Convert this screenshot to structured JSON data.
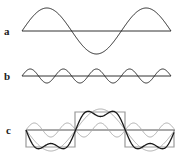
{
  "figure": {
    "panels": [
      {
        "label": "a",
        "description": "fundamental sine wave, 1.5 cycles, large amplitude"
      },
      {
        "label": "b",
        "description": "third harmonic sine wave, smaller amplitude"
      },
      {
        "label": "c",
        "description": "square wave with Fourier approximations (fundamental + harmonics)"
      }
    ]
  },
  "colors": {
    "dark": "#1a1a1a",
    "mid": "#555555",
    "light": "#9a9a9a"
  }
}
